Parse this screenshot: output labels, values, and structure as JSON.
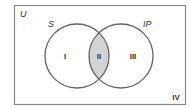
{
  "diagram": {
    "type": "venn",
    "universe_label": "U",
    "sets": [
      {
        "name": "S",
        "label": "S"
      },
      {
        "name": "IP",
        "label": "IP"
      }
    ],
    "regions": [
      {
        "id": "I",
        "label": "I",
        "description": "S only",
        "shaded": false
      },
      {
        "id": "II",
        "label": "II",
        "description": "S and IP",
        "shaded": true
      },
      {
        "id": "III",
        "label": "III",
        "description": "IP only",
        "shaded": false
      },
      {
        "id": "IV",
        "label": "IV",
        "description": "neither",
        "shaded": false
      }
    ],
    "colors": {
      "border": "#888888",
      "circle_stroke": "#666666",
      "shade": "#d3d3d3",
      "text": "#333333"
    }
  }
}
